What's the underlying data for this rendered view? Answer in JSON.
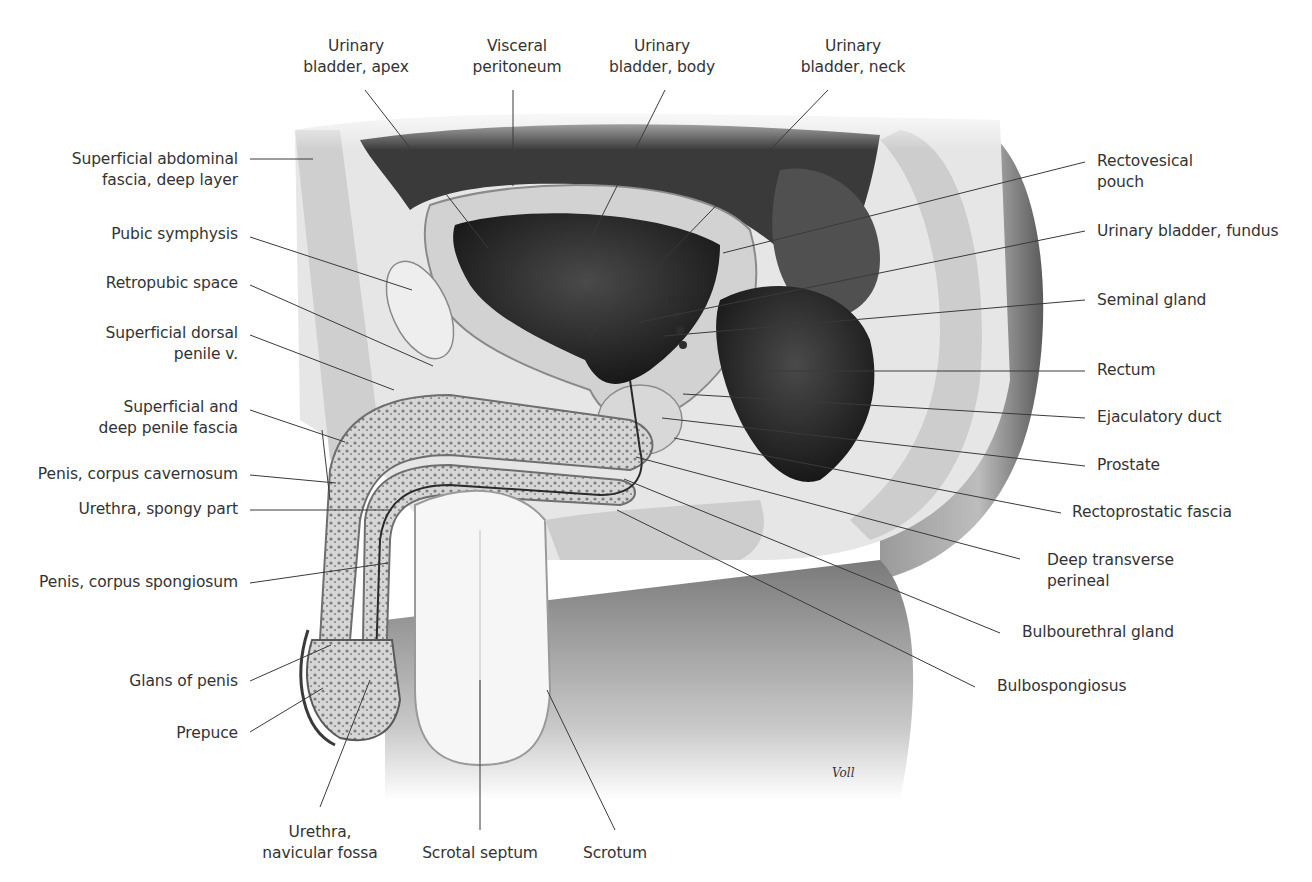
{
  "figure": {
    "style": "grayscale anatomical illustration",
    "signature": "Voll"
  },
  "labels": {
    "top": [
      {
        "id": "bladder-apex",
        "text": "Urinary\nbladder, apex",
        "line1": "Urinary",
        "line2": "bladder, apex"
      },
      {
        "id": "visceral-peritoneum",
        "text": "Visceral\nperitoneum",
        "line1": "Visceral",
        "line2": "peritoneum"
      },
      {
        "id": "bladder-body",
        "text": "Urinary\nbladder, body",
        "line1": "Urinary",
        "line2": "bladder, body"
      },
      {
        "id": "bladder-neck",
        "text": "Urinary\nbladder, neck",
        "line1": "Urinary",
        "line2": "bladder, neck"
      }
    ],
    "left": [
      {
        "id": "sup-abd-fascia",
        "line1": "Superficial abdominal",
        "line2": "fascia, deep layer"
      },
      {
        "id": "pubic-symphysis",
        "line1": "Pubic symphysis"
      },
      {
        "id": "retropubic-space",
        "line1": "Retropubic space"
      },
      {
        "id": "sup-dorsal-penile-v",
        "line1": "Superficial dorsal",
        "line2": "penile v."
      },
      {
        "id": "sup-deep-penile-fascia",
        "line1": "Superficial and",
        "line2": "deep penile fascia"
      },
      {
        "id": "corpus-cavernosum",
        "line1": "Penis, corpus cavernosum"
      },
      {
        "id": "urethra-spongy",
        "line1": "Urethra, spongy part"
      },
      {
        "id": "corpus-spongiosum",
        "line1": "Penis, corpus spongiosum"
      },
      {
        "id": "glans",
        "line1": "Glans of penis"
      },
      {
        "id": "prepuce",
        "line1": "Prepuce"
      }
    ],
    "right": [
      {
        "id": "rectovesical-pouch",
        "line1": "Rectovesical",
        "line2": "pouch"
      },
      {
        "id": "bladder-fundus",
        "line1": "Urinary bladder, fundus"
      },
      {
        "id": "seminal-gland",
        "line1": "Seminal gland"
      },
      {
        "id": "rectum",
        "line1": "Rectum"
      },
      {
        "id": "ejaculatory-duct",
        "line1": "Ejaculatory duct"
      },
      {
        "id": "prostate",
        "line1": "Prostate"
      },
      {
        "id": "rectoprostatic-fascia",
        "line1": "Rectoprostatic fascia"
      },
      {
        "id": "deep-transverse-perineal",
        "line1": "Deep transverse",
        "line2": "perineal"
      },
      {
        "id": "bulbourethral-gland",
        "line1": "Bulbourethral gland"
      },
      {
        "id": "bulbospongiosus",
        "line1": "Bulbospongiosus"
      }
    ],
    "bottom": [
      {
        "id": "navicular-fossa",
        "line1": "Urethra,",
        "line2": "navicular fossa"
      },
      {
        "id": "scrotal-septum",
        "line1": "Scrotal septum"
      },
      {
        "id": "scrotum",
        "line1": "Scrotum"
      }
    ]
  },
  "colors": {
    "background": "#ffffff",
    "label_text": "#333333",
    "leader_line": "#3a3a3a",
    "dark_cavity": "#1e1e1e",
    "tissue_light": "#e4e4e4",
    "tissue_mid": "#b8b8b8",
    "body_shadow": "#6a6a6a"
  }
}
